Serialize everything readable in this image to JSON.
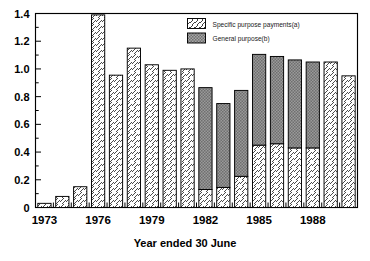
{
  "chart_data": {
    "type": "bar",
    "subtype": "stacked-vertical",
    "title": "",
    "xlabel": "Year ended 30 June",
    "ylabel": "",
    "ylim": [
      0,
      1.4
    ],
    "ytick_labels": [
      "0",
      "0.2",
      "0.4",
      "0.6",
      "0.8",
      "1.0",
      "1.2",
      "1.4"
    ],
    "ytick_values": [
      0,
      0.2,
      0.4,
      0.6,
      0.8,
      1.0,
      1.2,
      1.4
    ],
    "yminor_step": 0.1,
    "grid": false,
    "legend_position": "top-center-right",
    "categories": [
      1973,
      1974,
      1975,
      1976,
      1977,
      1978,
      1979,
      1980,
      1981,
      1982,
      1983,
      1984,
      1985,
      1986,
      1987,
      1988,
      1989,
      1990
    ],
    "xtick_labels": [
      "1973",
      "1976",
      "1979",
      "1982",
      "1985",
      "1988"
    ],
    "xtick_values": [
      1973,
      1976,
      1979,
      1982,
      1985,
      1988
    ],
    "series": [
      {
        "name": "Specific purpose payments(a)",
        "pattern": "diagonal-hatch",
        "color": "#ffffff",
        "values": [
          0.03,
          0.08,
          0.15,
          1.39,
          0.955,
          1.15,
          1.03,
          0.99,
          1.0,
          0.13,
          0.145,
          0.225,
          0.45,
          0.46,
          0.43,
          0.43,
          1.05,
          0.95
        ]
      },
      {
        "name": "General purpose(b)",
        "pattern": "stipple-gray",
        "color": "#8c8c8c",
        "values": [
          0,
          0,
          0,
          0,
          0,
          0,
          0,
          0,
          0,
          0.735,
          0.605,
          0.62,
          0.655,
          0.63,
          0.635,
          0.62,
          0,
          0
        ]
      }
    ],
    "totals": [
      0.03,
      0.08,
      0.15,
      1.39,
      0.955,
      1.15,
      1.03,
      0.99,
      1.0,
      0.865,
      0.75,
      0.845,
      1.105,
      1.09,
      1.065,
      1.05,
      1.05,
      0.95
    ]
  },
  "legend": {
    "items": [
      {
        "label": "Specific purpose payments(a)",
        "swatch": "hatch-swatch"
      },
      {
        "label": "General purpose(b)",
        "swatch": "stipple-swatch"
      }
    ]
  },
  "axis": {
    "xlabel": "Year ended 30 June"
  },
  "colors": {
    "general_purpose_fill": "#8c8c8c",
    "specific_purpose_fill": "#ffffff",
    "outline": "#000000"
  }
}
